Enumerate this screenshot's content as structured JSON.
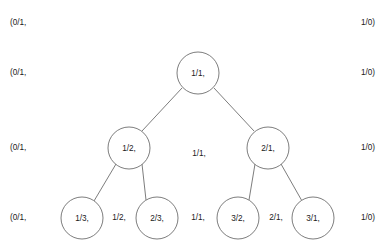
{
  "diagram": {
    "type": "stern-brocot-tree",
    "title": "",
    "background_color": "#ffffff",
    "stroke_color": "#6e6e6e",
    "text_color": "#1a1a1a",
    "rows": [
      {
        "row_index": 0,
        "y": 23,
        "left_label": "(0/1,",
        "right_label": "1/0)",
        "nodes": [],
        "gaps": []
      },
      {
        "row_index": 1,
        "y": 73,
        "left_label": "(0/1,",
        "right_label": "1/0)",
        "nodes": [
          {
            "label": "1/1,",
            "cx": 198,
            "cy": 73,
            "r": 21
          }
        ],
        "gaps": []
      },
      {
        "row_index": 2,
        "y": 148,
        "left_label": "(0/1,",
        "right_label": "1/0)",
        "nodes": [
          {
            "label": "1/2,",
            "cx": 129,
            "cy": 148,
            "r": 21
          },
          {
            "label": "2/1,",
            "cx": 268,
            "cy": 148,
            "r": 21
          }
        ],
        "gaps": [
          {
            "label": "1/1,",
            "x": 199,
            "y": 154
          }
        ]
      },
      {
        "row_index": 3,
        "y": 218,
        "left_label": "(0/1,",
        "right_label": "1/0)",
        "nodes": [
          {
            "label": "1/3,",
            "cx": 82,
            "cy": 218,
            "r": 21
          },
          {
            "label": "2/3,",
            "cx": 157,
            "cy": 218,
            "r": 21
          },
          {
            "label": "3/2,",
            "cx": 238,
            "cy": 218,
            "r": 21
          },
          {
            "label": "3/1,",
            "cx": 313,
            "cy": 218,
            "r": 21
          }
        ],
        "gaps": [
          {
            "label": "1/2,",
            "x": 119,
            "y": 218
          },
          {
            "label": "1/1,",
            "x": 198,
            "y": 218
          },
          {
            "label": "2/1,",
            "x": 276,
            "y": 218
          }
        ]
      }
    ],
    "side_labels": {
      "left_x": 10,
      "right_x": 375,
      "left_text": "(0/1,",
      "right_text": "1/0)",
      "rows_y": [
        23,
        73,
        148,
        218
      ]
    },
    "edges": [
      {
        "from": "1/1,",
        "to": "1/2,",
        "x1": 182,
        "y1": 88,
        "x2": 142,
        "y2": 131
      },
      {
        "from": "1/1,",
        "to": "2/1,",
        "x1": 214,
        "y1": 88,
        "x2": 254,
        "y2": 131
      },
      {
        "from": "1/2,",
        "to": "1/3,",
        "x1": 116,
        "y1": 164,
        "x2": 94,
        "y2": 201
      },
      {
        "from": "1/2,",
        "to": "2/3,",
        "x1": 142,
        "y1": 164,
        "x2": 146,
        "y2": 200
      },
      {
        "from": "2/1,",
        "to": "3/2,",
        "x1": 255,
        "y1": 164,
        "x2": 249,
        "y2": 200
      },
      {
        "from": "2/1,",
        "to": "3/1,",
        "x1": 281,
        "y1": 164,
        "x2": 302,
        "y2": 201
      }
    ]
  }
}
